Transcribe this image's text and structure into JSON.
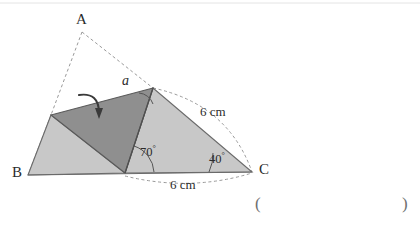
{
  "figure": {
    "type": "geometry-diagram",
    "vertex_labels": [
      {
        "name": "A",
        "text": "A",
        "x": 76,
        "y": 12
      },
      {
        "name": "B",
        "text": "B",
        "x": 12,
        "y": 165
      },
      {
        "name": "C",
        "text": "C",
        "x": 259,
        "y": 162
      }
    ],
    "angle_labels": [
      {
        "name": "angle-alpha",
        "text": "a",
        "x": 122,
        "y": 74
      },
      {
        "name": "angle-70",
        "value": "70",
        "unit": "°",
        "x": 140,
        "y": 144
      },
      {
        "name": "angle-40",
        "value": "40",
        "unit": "°",
        "x": 209,
        "y": 151
      }
    ],
    "dimension_labels": [
      {
        "name": "side-ac-length",
        "text": "6 cm",
        "x": 200,
        "y": 105
      },
      {
        "name": "side-bc-length",
        "text": "6 cm",
        "x": 170,
        "y": 178
      }
    ],
    "answer_brackets": {
      "open": "(",
      "close": ")",
      "open_x": 255,
      "close_x": 402,
      "y": 195
    },
    "geometry": {
      "point_A": [
        82,
        32
      ],
      "point_B": [
        28,
        175
      ],
      "point_C": [
        252,
        172
      ],
      "fold_apex": [
        153,
        88
      ],
      "fold_left": [
        51,
        115
      ],
      "fold_base": [
        125,
        173
      ]
    },
    "colors": {
      "light_fill": "#c8c8c8",
      "dark_fill": "#8f8f8f",
      "outline": "#5a5a5a",
      "dashed": "#9a9a9a",
      "text": "#2b2b2b",
      "background": "#ffffff",
      "paren": "#6f6f6f"
    }
  }
}
